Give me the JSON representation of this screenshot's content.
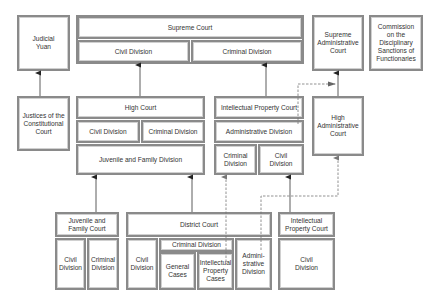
{
  "diagram": {
    "judicial_yuan": "Judicial\nYuan",
    "supreme_court": {
      "title": "Supreme Court",
      "civil": "Civil Division",
      "criminal": "Criminal Division"
    },
    "supreme_administrative_court": "Supreme\nAdministrative\nCourt",
    "commission": "Commission\non the\nDisciplinary\nSanctions of\nFunctionaries",
    "justices": "Justices of the\nConstitutional\nCourt",
    "high_court": {
      "title": "High Court",
      "civil": "Civil Division",
      "criminal": "Criminal Division",
      "juvenile": "Juvenile and Family Division"
    },
    "ip_court_high": {
      "title": "Intellectual Property Court",
      "administrative": "Administrative Division",
      "criminal": "Criminal\nDivision",
      "civil": "Civil\nDivision"
    },
    "high_administrative_court": "High\nAdministrative\nCourt",
    "juvenile_family_court": {
      "title": "Juvenile and\nFamily Court",
      "civil": "Civil\nDivision",
      "criminal": "Criminal\nDivision"
    },
    "district_court": {
      "title": "District Court",
      "civil": "Civil\nDivision",
      "criminal": "Criminal Division",
      "general": "General\nCases",
      "ip_cases": "Intellectual\nProperty\nCases",
      "administrative": "Admini-\nstrative\nDivision"
    },
    "ip_court_low": {
      "title": "Intellectual\nProperty Court",
      "civil": "Civil\nDivision"
    }
  }
}
